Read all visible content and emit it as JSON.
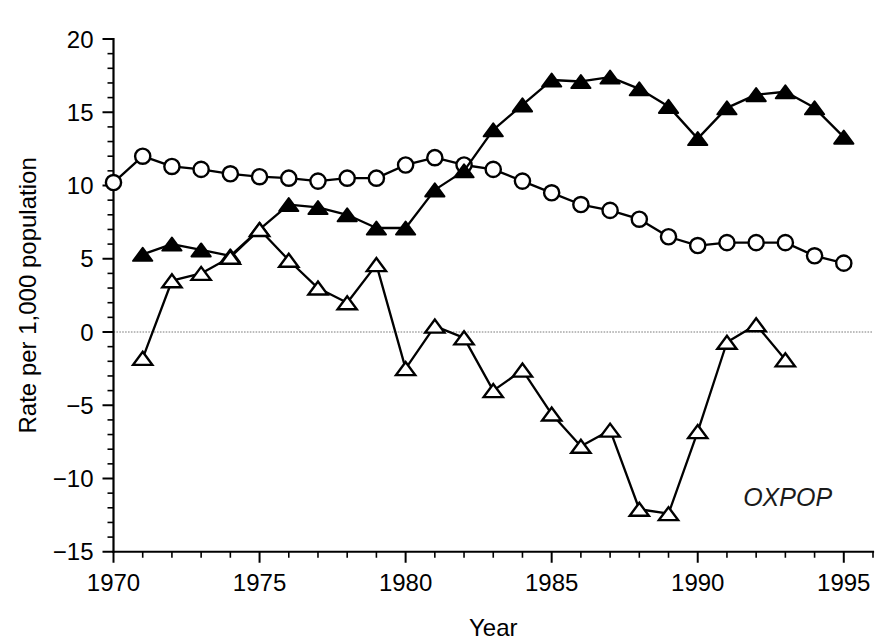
{
  "chart_data": {
    "type": "line",
    "title": "",
    "xlabel": "Year",
    "ylabel": "Rate per 1,000 population",
    "xlim": [
      1970,
      1996
    ],
    "ylim": [
      -15,
      20
    ],
    "xticks": [
      1970,
      1975,
      1980,
      1985,
      1990,
      1995
    ],
    "xtick_labels": [
      "1970",
      "1975",
      "1980",
      "1985",
      "1990",
      "1995"
    ],
    "yticks": [
      -15,
      -10,
      -5,
      0,
      5,
      10,
      15,
      20
    ],
    "ytick_labels": [
      "−15",
      "−10",
      "−5",
      "0",
      "5",
      "10",
      "15",
      "20"
    ],
    "minor_tick_step": 1,
    "grid": false,
    "zero_reference_line": true,
    "legend": "none",
    "annotations": [
      {
        "text": "OXPOP",
        "x": 1994.6,
        "y": -11.9,
        "style": "italic"
      }
    ],
    "series": [
      {
        "name": "open-circle-series",
        "marker": "open-circle",
        "x": [
          1970,
          1971,
          1972,
          1973,
          1974,
          1975,
          1976,
          1977,
          1978,
          1979,
          1980,
          1981,
          1982,
          1983,
          1984,
          1985,
          1986,
          1987,
          1988,
          1989,
          1990,
          1991,
          1992,
          1993,
          1994,
          1995
        ],
        "values": [
          10.2,
          12.0,
          11.3,
          11.1,
          10.8,
          10.6,
          10.5,
          10.3,
          10.5,
          10.5,
          11.4,
          11.9,
          11.4,
          11.1,
          10.3,
          9.5,
          8.7,
          8.3,
          7.7,
          6.5,
          5.9,
          6.1,
          6.1,
          6.1,
          5.2,
          4.7
        ]
      },
      {
        "name": "filled-triangle-series",
        "marker": "filled-triangle",
        "x": [
          1971,
          1972,
          1973,
          1974,
          1975,
          1976,
          1977,
          1978,
          1979,
          1980,
          1981,
          1982,
          1983,
          1984,
          1985,
          1986,
          1987,
          1988,
          1989,
          1990,
          1991,
          1992,
          1993,
          1994,
          1995
        ],
        "values": [
          5.3,
          6.0,
          5.6,
          5.2,
          7.0,
          8.7,
          8.5,
          8.0,
          7.1,
          7.1,
          9.7,
          11.0,
          13.8,
          15.5,
          17.2,
          17.1,
          17.4,
          16.6,
          15.4,
          13.2,
          15.3,
          16.2,
          16.4,
          15.3,
          13.3
        ]
      },
      {
        "name": "open-triangle-series",
        "marker": "open-triangle",
        "x": [
          1971,
          1972,
          1973,
          1974,
          1975,
          1976,
          1977,
          1978,
          1979,
          1980,
          1981,
          1982,
          1983,
          1984,
          1985,
          1986,
          1987,
          1988,
          1989,
          1990,
          1991,
          1992,
          1993
        ],
        "values": [
          -1.8,
          3.5,
          4.0,
          5.1,
          7.0,
          4.9,
          3.0,
          2.0,
          4.6,
          -2.5,
          0.4,
          -0.4,
          -4.0,
          -2.6,
          -5.6,
          -7.8,
          -6.7,
          -12.1,
          -12.4,
          -6.8,
          -0.7,
          0.5,
          -1.9
        ]
      }
    ]
  },
  "colors": {
    "axis": "#000000",
    "series": "#000000",
    "marker_fill_open": "#ffffff",
    "marker_fill_closed": "#000000",
    "zero_line": "#7a7a7a",
    "background": "#ffffff"
  }
}
